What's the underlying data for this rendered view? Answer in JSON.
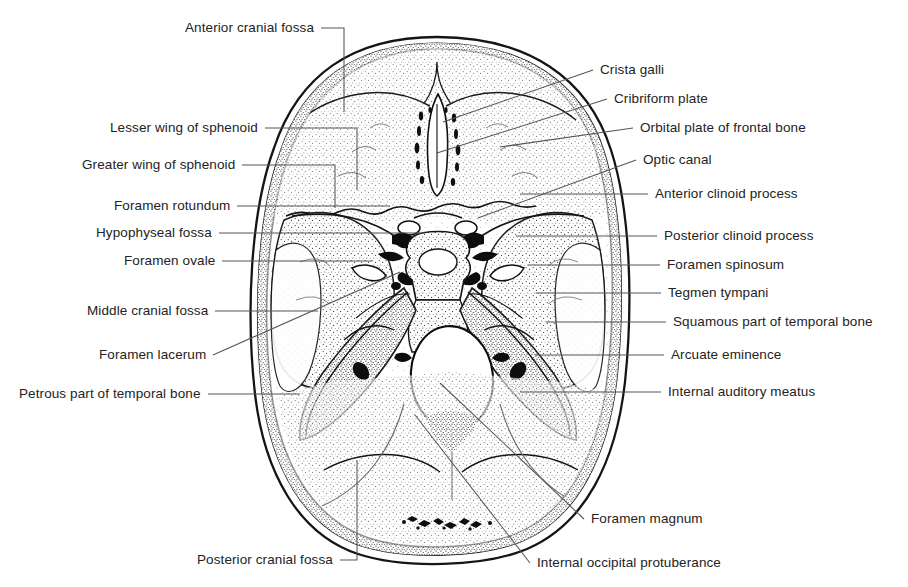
{
  "figure": {
    "background_color": "#ffffff",
    "ink_color": "#232323",
    "leader_color": "#555555"
  },
  "labels_left": [
    {
      "id": "anterior-cranial-fossa",
      "text": "Anterior cranial fossa",
      "x": 185,
      "y": 28,
      "leader": "elbow",
      "lx": 344,
      "ly": 28,
      "tx": 344,
      "ty": 112
    },
    {
      "id": "lesser-wing-of-sphenoid",
      "text": "Lesser wing of sphenoid",
      "x": 110,
      "y": 128,
      "leader": "elbow",
      "lx": 357,
      "ly": 128,
      "tx": 357,
      "ty": 190
    },
    {
      "id": "greater-wing-of-sphenoid",
      "text": "Greater wing of sphenoid",
      "x": 82,
      "y": 165,
      "leader": "elbow",
      "lx": 335,
      "ly": 165,
      "tx": 335,
      "ty": 208
    },
    {
      "id": "foramen-rotundum",
      "text": "Foramen rotundum",
      "x": 114,
      "y": 206,
      "leader": "line",
      "lx": 390,
      "ly": 206
    },
    {
      "id": "hypophyseal-fossa",
      "text": "Hypophyseal fossa",
      "x": 96,
      "y": 233,
      "leader": "line",
      "lx": 425,
      "ly": 233
    },
    {
      "id": "foramen-ovale",
      "text": "Foramen ovale",
      "x": 124,
      "y": 261,
      "leader": "line",
      "lx": 372,
      "ly": 261
    },
    {
      "id": "middle-cranial-fossa",
      "text": "Middle cranial fossa",
      "x": 87,
      "y": 311,
      "leader": "line",
      "lx": 318,
      "ly": 311
    },
    {
      "id": "foramen-lacerum",
      "text": "Foramen lacerum",
      "x": 99,
      "y": 355,
      "leader": "diag",
      "lx": 400,
      "ly": 272
    },
    {
      "id": "petrous-part-of-temporal-bone",
      "text": "Petrous part of temporal bone",
      "x": 19,
      "y": 394,
      "leader": "line",
      "lx": 300,
      "ly": 394
    },
    {
      "id": "posterior-cranial-fossa",
      "text": "Posterior cranial fossa",
      "x": 197,
      "y": 560,
      "leader": "elbow-up",
      "lx": 357,
      "ly": 560,
      "tx": 357,
      "ty": 460
    }
  ],
  "labels_right": [
    {
      "id": "crista-galli",
      "text": "Crista galli",
      "x": 600,
      "y": 70,
      "leader": "diag",
      "lx": 443,
      "ly": 122
    },
    {
      "id": "cribriform-plate",
      "text": "Cribriform plate",
      "x": 614,
      "y": 99,
      "leader": "diag",
      "lx": 437,
      "ly": 153
    },
    {
      "id": "orbital-plate-of-frontal-bone",
      "text": "Orbital plate of frontal bone",
      "x": 640,
      "y": 128,
      "leader": "diag",
      "lx": 500,
      "ly": 147
    },
    {
      "id": "optic-canal",
      "text": "Optic canal",
      "x": 643,
      "y": 160,
      "leader": "diag",
      "lx": 478,
      "ly": 218
    },
    {
      "id": "anterior-clinoid-process",
      "text": "Anterior clinoid process",
      "x": 655,
      "y": 194,
      "leader": "line",
      "lx": 520,
      "ly": 194
    },
    {
      "id": "posterior-clinoid-process",
      "text": "Posterior clinoid process",
      "x": 664,
      "y": 236,
      "leader": "line",
      "lx": 516,
      "ly": 236
    },
    {
      "id": "foramen-spinosum",
      "text": "Foramen spinosum",
      "x": 667,
      "y": 265,
      "leader": "line",
      "lx": 528,
      "ly": 265
    },
    {
      "id": "tegmen-tympani",
      "text": "Tegmen tympani",
      "x": 668,
      "y": 293,
      "leader": "line",
      "lx": 536,
      "ly": 293
    },
    {
      "id": "squamous-part-of-temporal-bone",
      "text": "Squamous part of temporal bone",
      "x": 673,
      "y": 322,
      "leader": "line",
      "lx": 546,
      "ly": 322
    },
    {
      "id": "arcuate-eminence",
      "text": "Arcuate eminence",
      "x": 671,
      "y": 355,
      "leader": "line",
      "lx": 535,
      "ly": 355
    },
    {
      "id": "internal-auditory-meatus",
      "text": "Internal auditory meatus",
      "x": 668,
      "y": 392,
      "leader": "diag",
      "lx": 520,
      "ly": 392
    },
    {
      "id": "foramen-magnum",
      "text": "Foramen magnum",
      "x": 591,
      "y": 519,
      "leader": "diag",
      "lx": 440,
      "ly": 383
    },
    {
      "id": "internal-occipital-protuberance",
      "text": "Internal occipital protuberance",
      "x": 537,
      "y": 563,
      "leader": "diag",
      "lx": 415,
      "ly": 415
    }
  ],
  "anatomy": {
    "skull_outline": "oval cranial base, outer table and inner table double contour",
    "foramen_magnum": {
      "cx": 452,
      "cy": 378,
      "rx": 41,
      "ry": 52
    },
    "crista_galli": "midline vertical ridge anterior",
    "regions": [
      "anterior cranial fossa",
      "middle cranial fossa",
      "posterior cranial fossa"
    ]
  }
}
